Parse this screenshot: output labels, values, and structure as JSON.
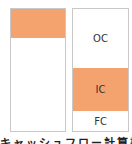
{
  "colors": {
    "highlight": "#f4a26e",
    "border": "#c8c8c8"
  },
  "left_box": {
    "segments": [
      {
        "label": "",
        "highlighted": true
      },
      {
        "label": "",
        "highlighted": false
      }
    ]
  },
  "right_box": {
    "segments": [
      {
        "label": "OC",
        "highlighted": false
      },
      {
        "label": "IC",
        "highlighted": true
      },
      {
        "label": "FC",
        "highlighted": false
      }
    ]
  },
  "caption": "キャッシュフロー計算書"
}
